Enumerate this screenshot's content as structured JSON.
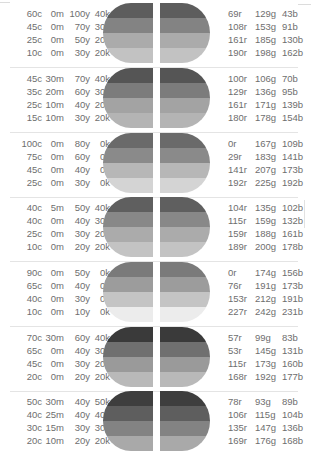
{
  "groups": [
    {
      "cmyk": [
        [
          "60c",
          "0m",
          "100y",
          "40k"
        ],
        [
          "45c",
          "0m",
          "70y",
          "30k"
        ],
        [
          "25c",
          "0m",
          "50y",
          "20k"
        ],
        [
          "10c",
          "0m",
          "30y",
          "20k"
        ]
      ],
      "rgb": [
        [
          "69r",
          "129g",
          "43b"
        ],
        [
          "108r",
          "153g",
          "91b"
        ],
        [
          "161r",
          "185g",
          "130b"
        ],
        [
          "190r",
          "198g",
          "162b"
        ]
      ],
      "stripes": [
        "#5d5d5d",
        "#838383",
        "#ababab",
        "#c2c2c2"
      ]
    },
    {
      "cmyk": [
        [
          "45c",
          "30m",
          "70y",
          "40k"
        ],
        [
          "35c",
          "20m",
          "60y",
          "30k"
        ],
        [
          "25c",
          "10m",
          "40y",
          "20k"
        ],
        [
          "15c",
          "10m",
          "30y",
          "20k"
        ]
      ],
      "rgb": [
        [
          "100r",
          "106g",
          "70b"
        ],
        [
          "129r",
          "136g",
          "95b"
        ],
        [
          "161r",
          "171g",
          "139b"
        ],
        [
          "180r",
          "178g",
          "154b"
        ]
      ],
      "stripes": [
        "#555555",
        "#7c7c7c",
        "#a3a3a3",
        "#b4b4b4"
      ]
    },
    {
      "cmyk": [
        [
          "100c",
          "0m",
          "80y",
          "0k"
        ],
        [
          "75c",
          "0m",
          "60y",
          "0k"
        ],
        [
          "45c",
          "0m",
          "40y",
          "0k"
        ],
        [
          "25c",
          "0m",
          "30y",
          "0k"
        ]
      ],
      "rgb": [
        [
          "0r",
          "167g",
          "109b"
        ],
        [
          "29r",
          "183g",
          "141b"
        ],
        [
          "141r",
          "207g",
          "173b"
        ],
        [
          "192r",
          "225g",
          "192b"
        ]
      ],
      "stripes": [
        "#6a6a6a",
        "#8a8a8a",
        "#b7b7b7",
        "#d4d4d4"
      ]
    },
    {
      "cmyk": [
        [
          "40c",
          "5m",
          "50y",
          "40k"
        ],
        [
          "40c",
          "0m",
          "40y",
          "30k"
        ],
        [
          "25c",
          "0m",
          "30y",
          "20k"
        ],
        [
          "10c",
          "0m",
          "20y",
          "20k"
        ]
      ],
      "rgb": [
        [
          "104r",
          "135g",
          "102b"
        ],
        [
          "115r",
          "159g",
          "132b"
        ],
        [
          "159r",
          "188g",
          "161b"
        ],
        [
          "189r",
          "200g",
          "178b"
        ]
      ],
      "stripes": [
        "#5f5f5f",
        "#888888",
        "#ababab",
        "#c3c3c3"
      ]
    },
    {
      "cmyk": [
        [
          "90c",
          "0m",
          "50y",
          "0k"
        ],
        [
          "65c",
          "0m",
          "40y",
          "0k"
        ],
        [
          "40c",
          "0m",
          "30y",
          "0k"
        ],
        [
          "10c",
          "0m",
          "10y",
          "0k"
        ]
      ],
      "rgb": [
        [
          "0r",
          "174g",
          "156b"
        ],
        [
          "76r",
          "191g",
          "173b"
        ],
        [
          "153r",
          "212g",
          "191b"
        ],
        [
          "227r",
          "242g",
          "231b"
        ]
      ],
      "stripes": [
        "#7a7a7a",
        "#9c9c9c",
        "#c4c4c4",
        "#ececec"
      ]
    },
    {
      "cmyk": [
        [
          "70c",
          "30m",
          "60y",
          "40k"
        ],
        [
          "65c",
          "0m",
          "40y",
          "30k"
        ],
        [
          "45c",
          "0m",
          "30y",
          "20k"
        ],
        [
          "20c",
          "0m",
          "20y",
          "20k"
        ]
      ],
      "rgb": [
        [
          "57r",
          "99g",
          "83b"
        ],
        [
          "53r",
          "145g",
          "131b"
        ],
        [
          "115r",
          "173g",
          "160b"
        ],
        [
          "168r",
          "192g",
          "177b"
        ]
      ],
      "stripes": [
        "#3a3a3a",
        "#707070",
        "#9a9a9a",
        "#b9b9b9"
      ]
    },
    {
      "cmyk": [
        [
          "50c",
          "30m",
          "40y",
          "50k"
        ],
        [
          "40c",
          "25m",
          "40y",
          "40k"
        ],
        [
          "30c",
          "15m",
          "30y",
          "30k"
        ],
        [
          "20c",
          "10m",
          "20y",
          "20k"
        ]
      ],
      "rgb": [
        [
          "78r",
          "93g",
          "89b"
        ],
        [
          "106r",
          "115g",
          "104b"
        ],
        [
          "135r",
          "147g",
          "136b"
        ],
        [
          "169r",
          "176g",
          "168b"
        ]
      ],
      "stripes": [
        "#3e3e3e",
        "#5e5e5e",
        "#838383",
        "#a9a9a9"
      ]
    }
  ]
}
